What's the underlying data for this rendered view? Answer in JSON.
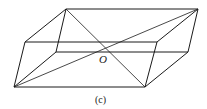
{
  "figure": {
    "center_label": "O",
    "caption": "(c)",
    "stroke_color": "#1a1a1a",
    "background": "#ffffff"
  },
  "vertices": {
    "front_bottom_left": [
      14,
      87
    ],
    "front_bottom_right": [
      145,
      87
    ],
    "front_top_left": [
      25,
      42
    ],
    "front_top_right": [
      157,
      42
    ],
    "back_top_left": [
      66,
      9
    ],
    "back_top_right": [
      198,
      9
    ],
    "back_bottom_left": [
      56,
      52
    ],
    "back_bottom_right": [
      188,
      52
    ]
  }
}
